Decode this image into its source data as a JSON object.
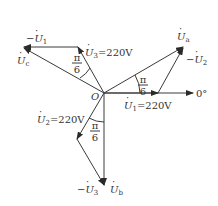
{
  "diagram": {
    "type": "phasor-diagram",
    "origin_label": "O",
    "axis_label": "0°",
    "colors": {
      "line": "#3a3a3a",
      "text": "#333333",
      "background": "#ffffff"
    },
    "phasors": {
      "U1": {
        "label": "U",
        "sub": "1",
        "value_text": "=220V",
        "angle": "0°"
      },
      "U2": {
        "label": "U",
        "sub": "2",
        "value_text": "=220V",
        "angle": "-120°"
      },
      "U3": {
        "label": "U",
        "sub": "3",
        "value_text": "=220V",
        "angle": "120°"
      },
      "negU1": {
        "prefix": "−",
        "label": "U",
        "sub": "1"
      },
      "negU2": {
        "prefix": "−",
        "label": "U",
        "sub": "2"
      },
      "negU3": {
        "prefix": "−",
        "label": "U",
        "sub": "3"
      },
      "Ua": {
        "label": "U",
        "sub": "a"
      },
      "Ub": {
        "label": "U",
        "sub": "b"
      },
      "Uc": {
        "label": "U",
        "sub": "c"
      }
    },
    "angle_labels": [
      {
        "num": "π",
        "den": "6"
      },
      {
        "num": "π",
        "den": "6"
      },
      {
        "num": "π",
        "den": "6"
      }
    ]
  }
}
